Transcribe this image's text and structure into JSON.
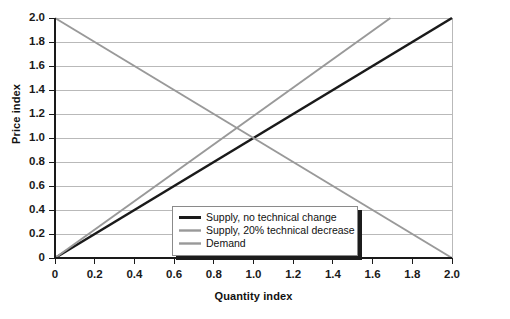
{
  "chart_data": {
    "type": "line",
    "title": "",
    "xlabel": "Quantity index",
    "ylabel": "Price index",
    "xlim": [
      0,
      2.0
    ],
    "ylim": [
      0,
      2.0
    ],
    "grid": "horizontal",
    "legend_position": "inside-bottom-center",
    "xticks": [
      "0",
      "0.2",
      "0.4",
      "0.6",
      "0.8",
      "1.0",
      "1.2",
      "1.4",
      "1.6",
      "1.8",
      "2.0"
    ],
    "yticks": [
      "0",
      "0.2",
      "0.4",
      "0.6",
      "0.8",
      "1.0",
      "1.2",
      "1.4",
      "1.6",
      "1.8",
      "2.0"
    ],
    "series": [
      {
        "name": "Supply, no technical change",
        "color": "#1a1a1a",
        "width": 2.6,
        "points": [
          [
            0,
            0
          ],
          [
            2.0,
            2.0
          ]
        ]
      },
      {
        "name": "Supply, 20% technical decrease",
        "color": "#999999",
        "width": 2.0,
        "points": [
          [
            0,
            0
          ],
          [
            1.69,
            2.0
          ]
        ]
      },
      {
        "name": "Demand",
        "color": "#999999",
        "width": 2.0,
        "points": [
          [
            0,
            2.0
          ],
          [
            2.0,
            0
          ]
        ]
      }
    ]
  },
  "legend": {
    "items": [
      {
        "label": "Supply, no technical change"
      },
      {
        "label": "Supply, 20% technical decrease"
      },
      {
        "label": "Demand"
      }
    ]
  },
  "colors": {
    "background": "#ffffff",
    "axis": "#1a1a1a",
    "gridline": "#b9b9b9",
    "series_dark": "#1a1a1a",
    "series_gray": "#999999",
    "legend_border": "#8a8a8a",
    "legend_shadow": "#1c1c1c"
  }
}
